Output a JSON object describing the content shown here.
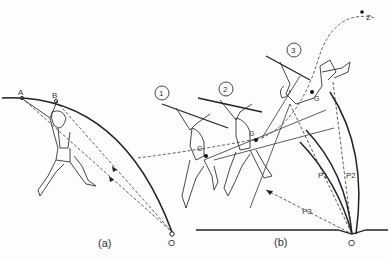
{
  "figure": {
    "panel_a": {
      "caption": "(a)",
      "points": {
        "A": "A",
        "B": "B",
        "O": "O"
      }
    },
    "panel_b": {
      "caption": "(b)",
      "phases": [
        "1",
        "2",
        "3"
      ],
      "center_of_mass_label": "G",
      "apex_label": "Z",
      "pivot_label": "O",
      "radii": [
        "P1",
        "P2",
        "P3"
      ]
    }
  },
  "colors": {
    "ink": "#222222",
    "background": "#fdfdfd"
  }
}
